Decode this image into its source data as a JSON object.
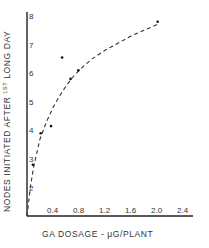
{
  "chart_data": {
    "type": "scatter",
    "title": "",
    "xlabel": "GA DOSAGE - μG/PLANT",
    "ylabel": "NODES INITIATED AFTER 1ST LONG DAY",
    "xlim": [
      0,
      2.4
    ],
    "ylim": [
      1,
      8
    ],
    "x_ticks": [
      "0.4",
      "0.8",
      "1.2",
      "1.6",
      "2.0",
      "2.4"
    ],
    "y_ticks": [
      "2",
      "3",
      "4",
      "5",
      "6",
      "7",
      "8"
    ],
    "grid": false,
    "legend": null,
    "series": [
      {
        "name": "observed",
        "marker": "dot",
        "x": [
          0.09,
          0.21,
          0.37,
          0.54,
          0.67,
          0.79,
          2.01
        ],
        "y": [
          2.8,
          3.9,
          4.15,
          6.55,
          5.8,
          6.1,
          7.8
        ]
      },
      {
        "name": "fitted curve",
        "style": "dashed",
        "x": [
          0.0,
          0.05,
          0.1,
          0.2,
          0.3,
          0.4,
          0.5,
          0.6,
          0.7,
          0.8,
          0.9,
          1.0,
          1.2,
          1.4,
          1.6,
          1.8,
          2.0
        ],
        "y": [
          1.0,
          2.0,
          2.7,
          3.7,
          4.3,
          4.8,
          5.2,
          5.55,
          5.85,
          6.1,
          6.3,
          6.5,
          6.8,
          7.05,
          7.3,
          7.5,
          7.7
        ]
      }
    ]
  },
  "labels": {
    "xlabel": "GA DOSAGE - μG/PLANT",
    "ylabel_main": "NODES  INITIATED  AFTER ",
    "ylabel_sup": "1ST",
    "ylabel_end": " LONG DAY"
  }
}
